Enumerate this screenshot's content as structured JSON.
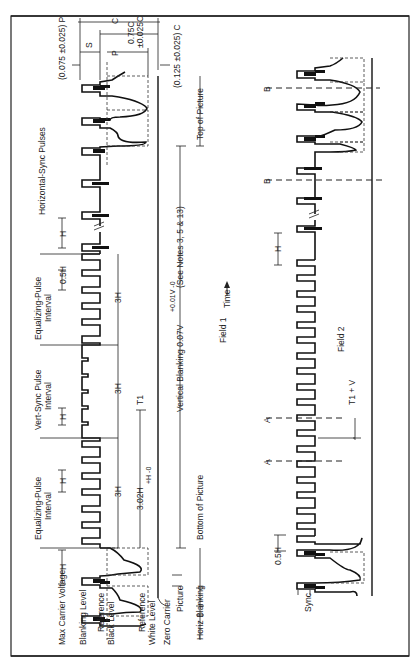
{
  "figure": {
    "orientation": "rotated -90deg (text reads bottom-to-top)",
    "field1_label": "Field 1",
    "field2_label": "Field 2",
    "time_label": "Time",
    "time_arrow_icon": "arrow-right-icon"
  },
  "field1": {
    "level_labels": {
      "max_carrier": "Max Carrier Voltage",
      "blanking": "Blanking Level",
      "ref_black_1": "Reference",
      "ref_black_2": "Black Level",
      "ref_white_1": "Reference",
      "ref_white_2": "White Level",
      "zero_carrier": "Zero Carrier",
      "picture": "Picture",
      "horiz_blanking": "Horiz Blanking"
    },
    "intervals": {
      "equalizing_1_a": "Equalizing-Pulse",
      "equalizing_1_b": "Interval",
      "vert_sync_a": "Vert-Sync Pulse",
      "vert_sync_b": "Interval",
      "equalizing_2_a": "Equalizing-Pulse",
      "equalizing_2_b": "Interval",
      "horizontal_sync": "Horizontal-Sync Pulses"
    },
    "dimensions": {
      "h_1": "H",
      "h_2": "H",
      "h_3": "H",
      "h_4": "H",
      "half_h": "0.5H",
      "three_h_1": "3H",
      "three_h_2": "3H",
      "three_h_3": "3H",
      "t1_span": "3.02H",
      "t1_span_tol": "+H  -0",
      "t1": "T1",
      "vertical_blanking": "Vertical Blanking  0.07V",
      "vertical_blanking_tol": "+0.01V  -0",
      "vertical_blanking_note": "(See Notes 3, 5 & 13)",
      "bottom_of_picture": "Bottom of Picture",
      "top_of_picture": "Top of Picture"
    },
    "tolerances": {
      "c": "C",
      "s": "S",
      "p": "P",
      "sync_075": "(0.075 ±0.025) P",
      "c_075": "0.75C",
      "c_075_tol": "±0.025C",
      "c_125": "(0.125 ±0.025) C"
    }
  },
  "field2": {
    "labels": {
      "sync": "Sync",
      "half_h": "0.5H",
      "h": "H",
      "t1_v": "T1 + V",
      "marker_a_1": "A",
      "marker_a_2": "A",
      "marker_b_1": "B",
      "marker_b_2": "B"
    }
  }
}
